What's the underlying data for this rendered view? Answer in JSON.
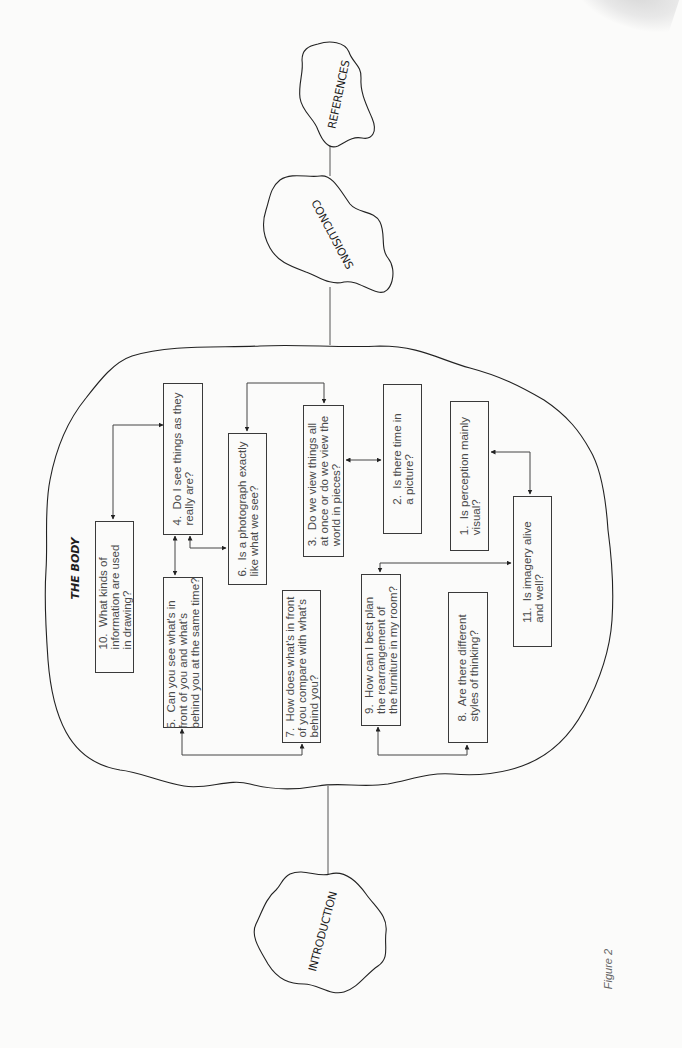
{
  "figure": {
    "caption": "Figure 2",
    "orientation": "rotated -90deg (landscape printed sideways)"
  },
  "sections": {
    "references": {
      "label": "REFERENCES"
    },
    "conclusions": {
      "label": "CONCLUSIONS"
    },
    "body": {
      "label": "THE BODY"
    },
    "introduction": {
      "label": "INTRODUCTION"
    }
  },
  "questions": [
    {
      "id": 1,
      "text": "1.  Is perception mainly\nvisual?"
    },
    {
      "id": 2,
      "text": "2.  Is there time in\na picture?"
    },
    {
      "id": 3,
      "text": "3.  Do we view things all\nat once or do we view the\nworld in pieces?"
    },
    {
      "id": 4,
      "text": "4.  Do I see things as they\nreally are?"
    },
    {
      "id": 5,
      "text": "5.  Can you see what's in\nfront of you and what's\nbehind you at the same time?"
    },
    {
      "id": 6,
      "text": "6.  Is a photograph exactly\nlike what we see?"
    },
    {
      "id": 7,
      "text": "7.  How does what's in front\nof you compare with what's\nbehind you?"
    },
    {
      "id": 8,
      "text": "8.  Are there different\nstyles of thinking?"
    },
    {
      "id": 9,
      "text": "9.  How can I best plan\nthe rearrangement of\nthe furniture in my room?"
    },
    {
      "id": 10,
      "text": "10.  What kinds of\ninformation are used\nin drawing?"
    },
    {
      "id": 11,
      "text": "11.  Is imagery alive\nand well?"
    }
  ],
  "connections": [
    {
      "from": 4,
      "to": 10,
      "type": "bidirectional"
    },
    {
      "from": 4,
      "to": 5,
      "type": "bidirectional"
    },
    {
      "from": 4,
      "to": 6,
      "type": "bidirectional"
    },
    {
      "from": 6,
      "to": 3,
      "type": "bidirectional"
    },
    {
      "from": 3,
      "to": 2,
      "type": "bidirectional"
    },
    {
      "from": 1,
      "to": 11,
      "type": "bidirectional"
    },
    {
      "from": 9,
      "to": 11,
      "type": "bidirectional"
    },
    {
      "from": 5,
      "to": 7,
      "type": "bidirectional"
    },
    {
      "from": 9,
      "to": 8,
      "type": "bidirectional"
    }
  ],
  "flow": [
    "INTRODUCTION",
    "THE BODY",
    "CONCLUSIONS",
    "REFERENCES"
  ]
}
